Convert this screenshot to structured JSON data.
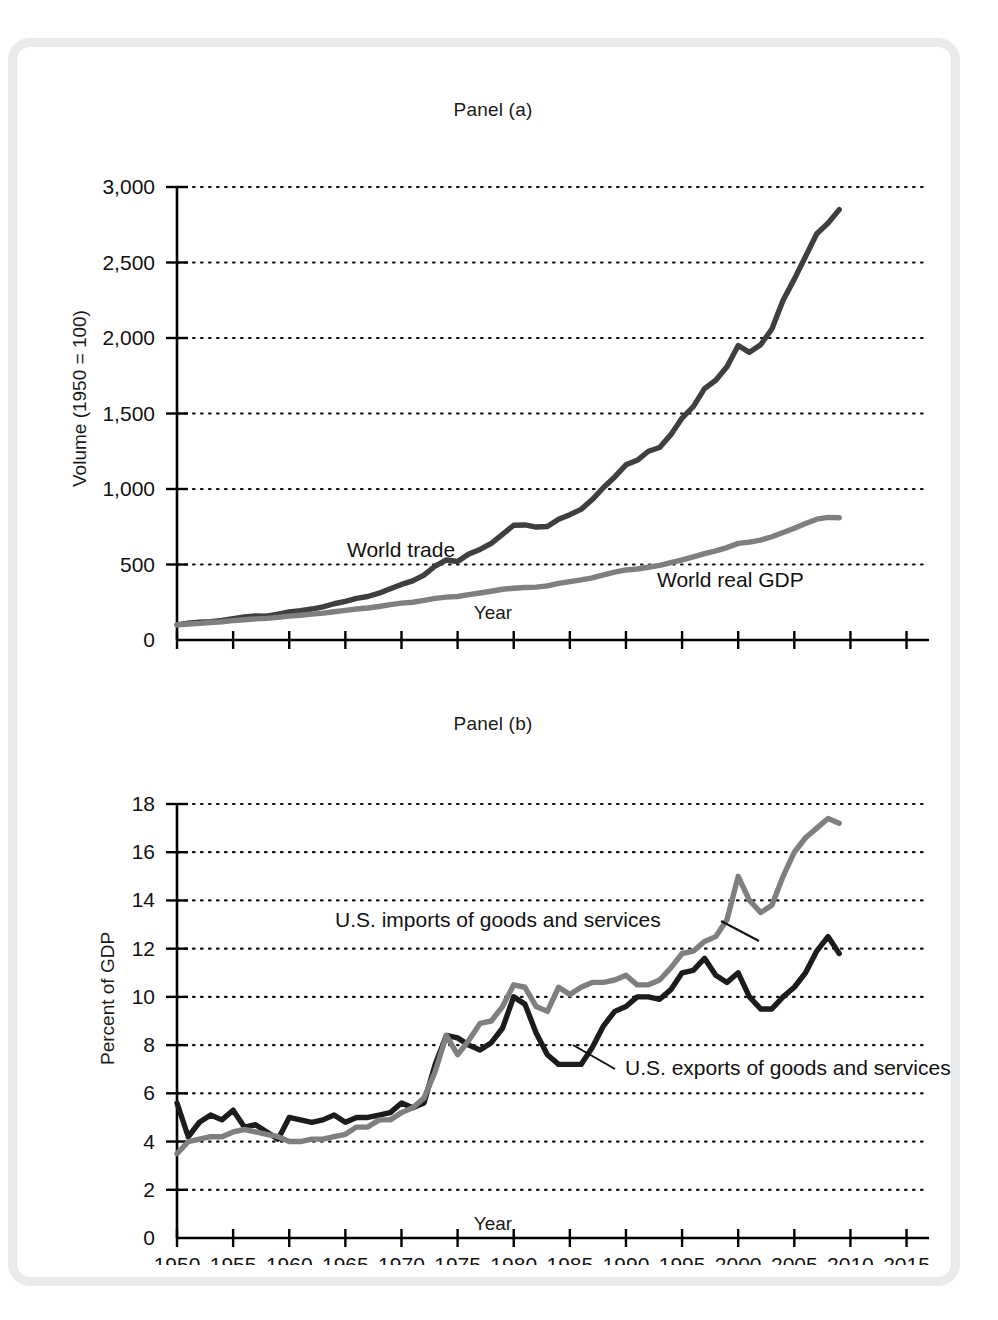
{
  "figure": {
    "frame_color": "#e9eaec",
    "background": "#ffffff",
    "dark_series_color": "#3f3f3f",
    "mid_series_color": "#7f7f7f",
    "black_series_color": "#1c1c1c",
    "axis_color": "#000000",
    "grid_color": "#111111"
  },
  "panel_a": {
    "title": "Panel (a)",
    "xlabel": "Year",
    "ylabel": "Volume (1950 = 100)",
    "ytick_labels": [
      "3,000",
      "2,500",
      "2,000",
      "1,500",
      "1,000",
      "500",
      "0"
    ],
    "xtick_labels": [
      "1950",
      "1955",
      "1960",
      "1965",
      "1970",
      "1975",
      "1980",
      "1985",
      "1990",
      "1995",
      "2000",
      "2005",
      "2010",
      "2015"
    ],
    "series_labels": {
      "trade": "World trade",
      "gdp": "World real GDP"
    }
  },
  "panel_b": {
    "title": "Panel (b)",
    "xlabel": "Year",
    "ylabel": "Percent of GDP",
    "ytick_labels": [
      "18",
      "16",
      "14",
      "12",
      "10",
      "8",
      "6",
      "4",
      "2",
      "0"
    ],
    "xtick_labels": [
      "1950",
      "1955",
      "1960",
      "1965",
      "1970",
      "1975",
      "1980",
      "1985",
      "1990",
      "1995",
      "2000",
      "2005",
      "2010",
      "2015"
    ],
    "series_labels": {
      "imports": "U.S. imports of goods and services",
      "exports": "U.S. exports of goods and services"
    }
  },
  "chart_data": [
    {
      "type": "line",
      "panel": "Panel (a)",
      "title": "Panel (a)",
      "xlabel": "Year",
      "ylabel": "Volume (1950 = 100)",
      "xlim": [
        1950,
        2017
      ],
      "ylim": [
        0,
        3000
      ],
      "yticks": [
        0,
        500,
        1000,
        1500,
        2000,
        2500,
        3000
      ],
      "xticks": [
        1950,
        1955,
        1960,
        1965,
        1970,
        1975,
        1980,
        1985,
        1990,
        1995,
        2000,
        2005,
        2010,
        2015
      ],
      "grid": "horizontal-dotted",
      "legend": "inline-annotations",
      "x": [
        1950,
        1951,
        1952,
        1953,
        1954,
        1955,
        1956,
        1957,
        1958,
        1959,
        1960,
        1961,
        1962,
        1963,
        1964,
        1965,
        1966,
        1967,
        1968,
        1969,
        1970,
        1971,
        1972,
        1973,
        1974,
        1975,
        1976,
        1977,
        1978,
        1979,
        1980,
        1981,
        1982,
        1983,
        1984,
        1985,
        1986,
        1987,
        1988,
        1989,
        1990,
        1991,
        1992,
        1993,
        1994,
        1995,
        1996,
        1997,
        1998,
        1999,
        2000,
        2001,
        2002,
        2003,
        2004,
        2005,
        2006,
        2007,
        2008,
        2009
      ],
      "series": [
        {
          "name": "World trade",
          "color": "#3f3f3f",
          "values": [
            100,
            112,
            118,
            122,
            130,
            142,
            152,
            160,
            158,
            172,
            186,
            194,
            205,
            220,
            240,
            256,
            276,
            288,
            310,
            340,
            368,
            392,
            430,
            490,
            530,
            520,
            570,
            600,
            640,
            700,
            760,
            762,
            748,
            752,
            800,
            830,
            865,
            930,
            1010,
            1080,
            1160,
            1190,
            1250,
            1275,
            1360,
            1470,
            1545,
            1665,
            1720,
            1810,
            1950,
            1905,
            1955,
            2060,
            2250,
            2390,
            2540,
            2690,
            2760,
            2850
          ]
        },
        {
          "name": "World real GDP",
          "color": "#7f7f7f",
          "values": [
            100,
            106,
            110,
            116,
            121,
            128,
            134,
            140,
            143,
            150,
            158,
            164,
            171,
            178,
            187,
            196,
            205,
            212,
            222,
            234,
            244,
            250,
            262,
            276,
            284,
            288,
            300,
            311,
            323,
            336,
            343,
            348,
            350,
            358,
            375,
            387,
            398,
            412,
            432,
            450,
            464,
            470,
            482,
            494,
            512,
            530,
            550,
            572,
            590,
            612,
            640,
            648,
            662,
            684,
            712,
            740,
            772,
            800,
            812,
            810
          ]
        }
      ]
    },
    {
      "type": "line",
      "panel": "Panel (b)",
      "title": "Panel (b)",
      "xlabel": "Year",
      "ylabel": "Percent of GDP",
      "xlim": [
        1950,
        2017
      ],
      "ylim": [
        0,
        18
      ],
      "yticks": [
        0,
        2,
        4,
        6,
        8,
        10,
        12,
        14,
        16,
        18
      ],
      "xticks": [
        1950,
        1955,
        1960,
        1965,
        1970,
        1975,
        1980,
        1985,
        1990,
        1995,
        2000,
        2005,
        2010,
        2015
      ],
      "grid": "horizontal-dotted",
      "legend": "inline-annotations",
      "x": [
        1950,
        1951,
        1952,
        1953,
        1954,
        1955,
        1956,
        1957,
        1958,
        1959,
        1960,
        1961,
        1962,
        1963,
        1964,
        1965,
        1966,
        1967,
        1968,
        1969,
        1970,
        1971,
        1972,
        1973,
        1974,
        1975,
        1976,
        1977,
        1978,
        1979,
        1980,
        1981,
        1982,
        1983,
        1984,
        1985,
        1986,
        1987,
        1988,
        1989,
        1990,
        1991,
        1992,
        1993,
        1994,
        1995,
        1996,
        1997,
        1998,
        1999,
        2000,
        2001,
        2002,
        2003,
        2004,
        2005,
        2006,
        2007,
        2008,
        2009
      ],
      "series": [
        {
          "name": "U.S. exports of goods and services",
          "color": "#1c1c1c",
          "values": [
            5.6,
            4.2,
            4.8,
            5.1,
            4.9,
            5.3,
            4.6,
            4.7,
            4.4,
            4.1,
            5.0,
            4.9,
            4.8,
            4.9,
            5.1,
            4.8,
            5.0,
            5.0,
            5.1,
            5.2,
            5.6,
            5.4,
            5.6,
            7.2,
            8.4,
            8.3,
            8.0,
            7.8,
            8.1,
            8.7,
            10.0,
            9.7,
            8.5,
            7.6,
            7.2,
            7.2,
            7.2,
            7.9,
            8.8,
            9.4,
            9.6,
            10.0,
            10.0,
            9.9,
            10.3,
            11.0,
            11.1,
            11.6,
            10.9,
            10.6,
            11.0,
            10.0,
            9.5,
            9.5,
            10.0,
            10.4,
            11.0,
            11.9,
            12.5,
            11.8
          ]
        },
        {
          "name": "U.S. imports of goods and services",
          "color": "#7f7f7f",
          "values": [
            3.5,
            4.0,
            4.1,
            4.2,
            4.2,
            4.4,
            4.5,
            4.4,
            4.3,
            4.2,
            4.0,
            4.0,
            4.1,
            4.1,
            4.2,
            4.3,
            4.6,
            4.6,
            4.9,
            4.9,
            5.2,
            5.4,
            5.8,
            6.9,
            8.4,
            7.6,
            8.2,
            8.9,
            9.0,
            9.6,
            10.5,
            10.4,
            9.6,
            9.4,
            10.4,
            10.1,
            10.4,
            10.6,
            10.6,
            10.7,
            10.9,
            10.5,
            10.5,
            10.7,
            11.2,
            11.8,
            11.9,
            12.3,
            12.5,
            13.2,
            15.0,
            14.0,
            13.5,
            13.8,
            15.0,
            16.0,
            16.6,
            17.0,
            17.4,
            17.2
          ]
        }
      ]
    }
  ]
}
